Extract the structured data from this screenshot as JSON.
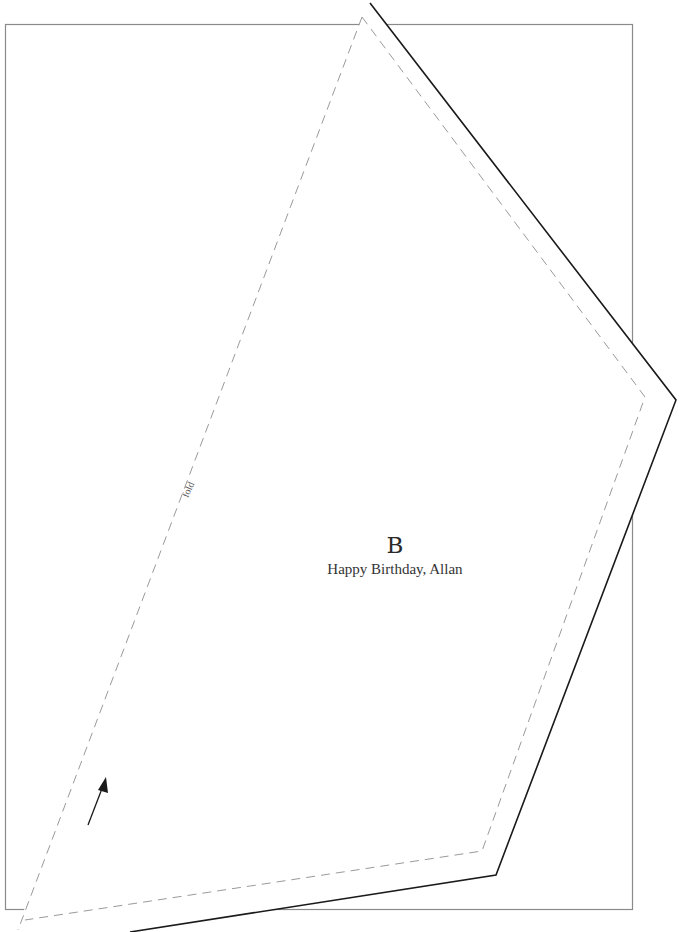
{
  "template": {
    "section_letter": "B",
    "message": "Happy Birthday, Allan",
    "fold_label": "fold"
  },
  "colors": {
    "page_border": "#8a8a8a",
    "cut_line": "#1a1a1a",
    "dashed_line": "#9a9a9a",
    "background": "#ffffff"
  }
}
